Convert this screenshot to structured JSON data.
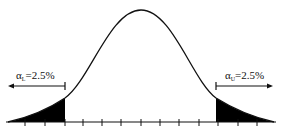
{
  "diagram": {
    "type": "two-tailed normal distribution",
    "colors": {
      "curve": "#111111",
      "fill": "#000000",
      "axis": "#111111",
      "background": "#ffffff"
    },
    "left_tail": {
      "symbol": "α",
      "subscript": "L",
      "equals": "=2.5%",
      "arrow_direction": "left"
    },
    "right_tail": {
      "symbol": "α",
      "subscript": "U",
      "equals": "=2.5%",
      "arrow_direction": "right"
    },
    "axis": {
      "tick_count": 13
    }
  }
}
